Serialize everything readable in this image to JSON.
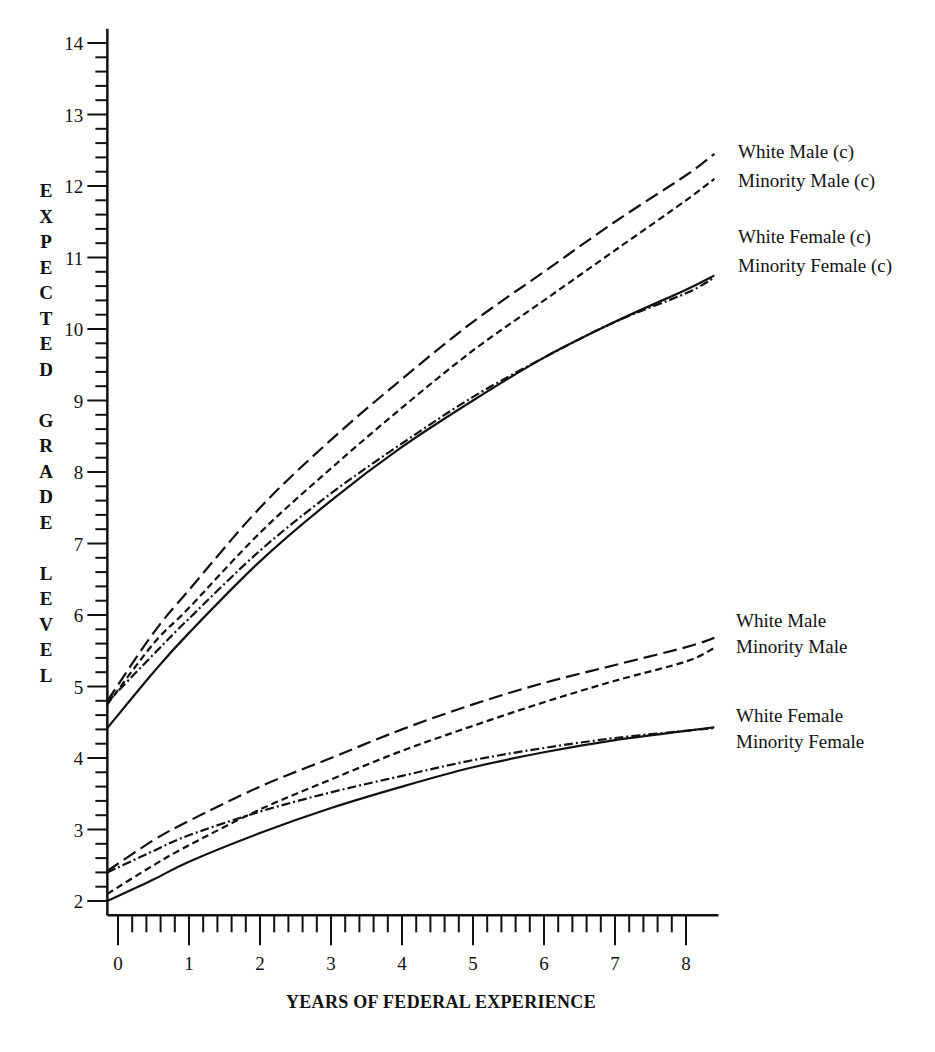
{
  "chart_data": {
    "type": "line",
    "title": "",
    "xlabel": "YEARS OF FEDERAL EXPERIENCE",
    "ylabel": "EXPECTED GRADE LEVEL",
    "xlim": [
      -0.15,
      8.4
    ],
    "ylim": [
      1.8,
      14.2
    ],
    "x_ticks": [
      0,
      1,
      2,
      3,
      4,
      5,
      6,
      7,
      8
    ],
    "y_ticks": [
      2,
      3,
      4,
      5,
      6,
      7,
      8,
      9,
      10,
      11,
      12,
      13,
      14
    ],
    "minor_tick_step": 0.2,
    "grid": false,
    "legend_position": "right, inline labels at line ends",
    "x": [
      -0.15,
      0.5,
      1,
      2,
      3,
      4,
      5,
      6,
      7,
      8,
      8.4
    ],
    "series": [
      {
        "name": "White Male (c)",
        "group": "upper",
        "dash": "14,6",
        "values": [
          4.8,
          5.75,
          6.35,
          7.5,
          8.45,
          9.3,
          10.1,
          10.8,
          11.5,
          12.15,
          12.45
        ]
      },
      {
        "name": "Minority Male (c)",
        "group": "upper",
        "dash": "7,4",
        "values": [
          4.75,
          5.6,
          6.1,
          7.15,
          8.05,
          8.9,
          9.7,
          10.4,
          11.1,
          11.8,
          12.1
        ]
      },
      {
        "name": "White Female (c)",
        "group": "upper",
        "dash": "",
        "values": [
          4.42,
          5.2,
          5.75,
          6.75,
          7.6,
          8.35,
          9.0,
          9.6,
          10.1,
          10.55,
          10.75
        ]
      },
      {
        "name": "Minority Female (c)",
        "group": "upper",
        "dash": "9,3,2,3",
        "values": [
          4.78,
          5.45,
          5.95,
          6.9,
          7.7,
          8.4,
          9.05,
          9.6,
          10.1,
          10.5,
          10.72
        ]
      },
      {
        "name": "White Male",
        "group": "lower",
        "dash": "14,6",
        "values": [
          2.42,
          2.85,
          3.12,
          3.6,
          4.0,
          4.4,
          4.75,
          5.05,
          5.3,
          5.55,
          5.68
        ]
      },
      {
        "name": "Minority Male",
        "group": "lower",
        "dash": "7,4",
        "values": [
          2.1,
          2.5,
          2.78,
          3.28,
          3.7,
          4.1,
          4.45,
          4.78,
          5.08,
          5.35,
          5.54
        ]
      },
      {
        "name": "White Female",
        "group": "lower",
        "dash": "",
        "values": [
          2.0,
          2.3,
          2.55,
          2.95,
          3.3,
          3.6,
          3.87,
          4.08,
          4.25,
          4.38,
          4.43
        ]
      },
      {
        "name": "Minority Female",
        "group": "lower",
        "dash": "9,3,2,3",
        "values": [
          2.4,
          2.7,
          2.92,
          3.25,
          3.52,
          3.75,
          3.97,
          4.14,
          4.28,
          4.38,
          4.42
        ]
      }
    ]
  },
  "axis": {
    "ylabel_letters": [
      "E",
      "X",
      "P",
      "E",
      "C",
      "T",
      "E",
      "D",
      " ",
      "G",
      "R",
      "A",
      "D",
      "E",
      " ",
      "L",
      "E",
      "V",
      "E",
      "L"
    ],
    "xtitle": "YEARS OF FEDERAL EXPERIENCE"
  },
  "labels": {
    "white_male_c": "White Male (c)",
    "minority_male_c": "Minority Male (c)",
    "white_female_c": "White Female (c)",
    "minority_female_c": "Minority Female (c)",
    "white_male": "White Male",
    "minority_male": "Minority Male",
    "white_female": "White Female",
    "minority_female": "Minority Female"
  },
  "colors": {
    "ink": "#111111",
    "background": "#ffffff"
  }
}
